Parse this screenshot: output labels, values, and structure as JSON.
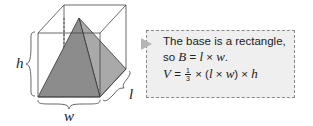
{
  "figure": {
    "labels": {
      "height": "h",
      "length": "l",
      "width": "w"
    },
    "colors": {
      "pyramid_front": "#8c8c8c",
      "pyramid_side": "#a9a9a9",
      "edge": "#333333"
    }
  },
  "note": {
    "line1": "The base is a rectangle,",
    "line2_prefix": "so ",
    "line2_B": "B",
    "line2_eq": " = ",
    "line2_l": "l",
    "line2_times": " × ",
    "line2_w": "w",
    "line2_end": ".",
    "line3_V": "V",
    "line3_eq": " = ",
    "line3_frac_num": "1",
    "line3_frac_den": "3",
    "line3_mid1": " × (",
    "line3_l": "l",
    "line3_times": " × ",
    "line3_w": "w",
    "line3_mid2": ") × ",
    "line3_h": "h"
  }
}
